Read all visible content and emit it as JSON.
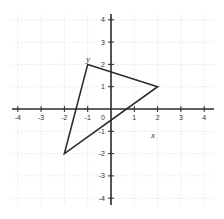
{
  "diagram": {
    "type": "coordinate-plane",
    "x_range": [
      -4,
      4
    ],
    "y_range": [
      -4,
      4
    ],
    "x_ticks": [
      -4,
      -3,
      -2,
      -1,
      1,
      2,
      3,
      4
    ],
    "y_ticks": [
      4,
      3,
      2,
      1,
      -1,
      -2,
      -3,
      -4
    ],
    "origin_label": "0",
    "x_axis_label": "x",
    "y_axis_label": "y",
    "grid": true,
    "triangle": {
      "vertices": [
        [
          -1,
          2
        ],
        [
          2,
          1
        ],
        [
          -2,
          -2
        ]
      ]
    },
    "colors": {
      "axis": "#2b2b2b",
      "grid": "#d9d9d9",
      "shape": "#2b2b2b",
      "background": "#ffffff"
    }
  },
  "labels": {
    "x_tick_labels": [
      "-4",
      "-3",
      "-2",
      "-1",
      "1",
      "2",
      "3",
      "4"
    ],
    "y_tick_labels": [
      "4",
      "3",
      "2",
      "1",
      "-1",
      "-2",
      "-3",
      "-4"
    ]
  }
}
